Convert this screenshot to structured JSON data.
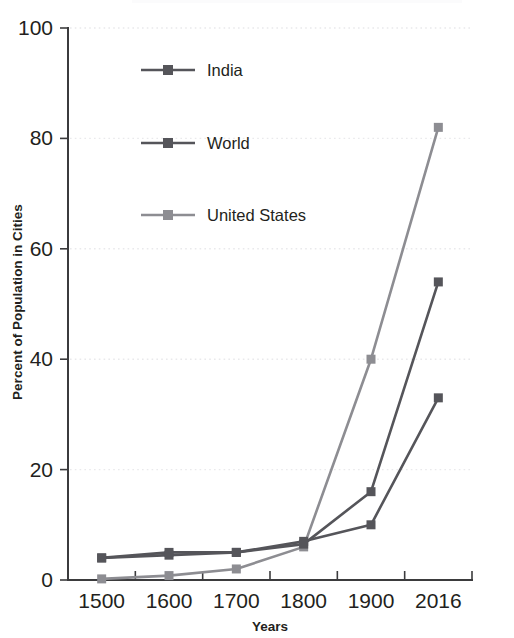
{
  "chart_data": {
    "type": "line",
    "title": "",
    "xlabel": "Years",
    "ylabel": "Percent of Population in Cities",
    "categories": [
      "1500",
      "1600",
      "1700",
      "1800",
      "1900",
      "2016"
    ],
    "x": [
      1500,
      1600,
      1700,
      1800,
      1900,
      2016
    ],
    "ylim": [
      0,
      100
    ],
    "yticks": [
      0,
      20,
      40,
      60,
      80,
      100
    ],
    "ytick_labels": [
      "0",
      "20",
      "40",
      "60",
      "80",
      "100"
    ],
    "grid": "horizontal-dotted",
    "legend_position": "upper-left-inside",
    "series": [
      {
        "name": "India",
        "color": "#55555a",
        "marker": "square",
        "values": [
          4,
          5,
          5,
          7,
          10,
          33
        ]
      },
      {
        "name": "World",
        "color": "#55555a",
        "marker": "square",
        "values": [
          4,
          4.5,
          5,
          6.5,
          16,
          54
        ]
      },
      {
        "name": "United States",
        "color": "#8d8d92",
        "marker": "square",
        "values": [
          0.2,
          0.8,
          2,
          6,
          40,
          82
        ]
      }
    ]
  },
  "axes": {
    "y_title": "Percent of Population in Cities",
    "x_title": "Years",
    "y_tick_0": "0",
    "y_tick_1": "20",
    "y_tick_2": "40",
    "y_tick_3": "60",
    "y_tick_4": "80",
    "y_tick_5": "100",
    "x_tick_0": "1500",
    "x_tick_1": "1600",
    "x_tick_2": "1700",
    "x_tick_3": "1800",
    "x_tick_4": "1900",
    "x_tick_5": "2016"
  },
  "legend": {
    "entry_0": "India",
    "entry_1": "World",
    "entry_2": "United States"
  },
  "colors": {
    "series_dark": "#55555a",
    "series_light": "#8d8d92",
    "axis": "#3b3b3d",
    "grid": "#e9e9ec",
    "text": "#231f20",
    "background": "#ffffff"
  }
}
